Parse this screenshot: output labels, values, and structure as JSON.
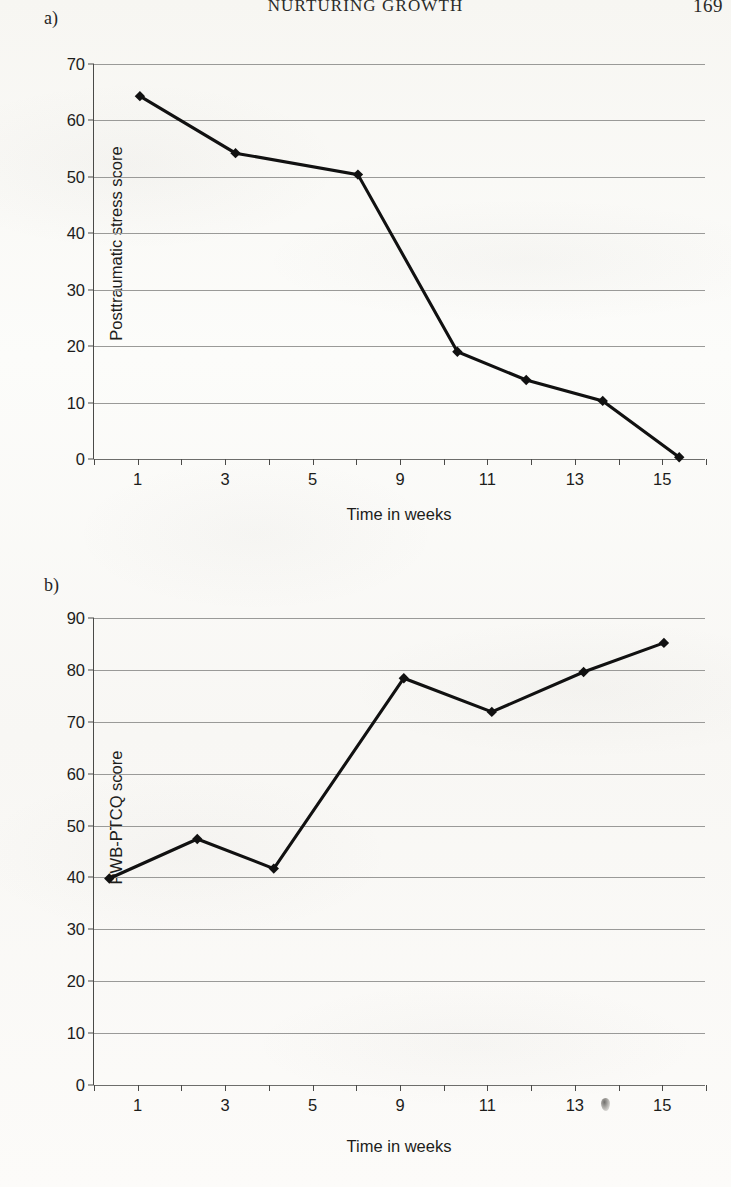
{
  "page": {
    "running_head": "NURTURING GROWTH",
    "folio": "169"
  },
  "panels": {
    "a_label": "a)",
    "b_label": "b)"
  },
  "chart_data": [
    {
      "type": "line",
      "panel": "a)",
      "title": "",
      "xlabel": "Time in weeks",
      "ylabel": "Posttraumatic stress score",
      "xlim": [
        0,
        16
      ],
      "ylim": [
        0,
        70
      ],
      "ytick_labels": [
        "0",
        "10",
        "20",
        "30",
        "40",
        "50",
        "60",
        "70"
      ],
      "yticks": [
        0,
        10,
        20,
        30,
        40,
        50,
        60,
        70
      ],
      "xtick_labels": [
        "1",
        "3",
        "5",
        "9",
        "11",
        "13",
        "15"
      ],
      "xticks": [
        1,
        3,
        5,
        9,
        11,
        13,
        15
      ],
      "grid": true,
      "legend": "none",
      "marker": "filled-diamond",
      "line_color": "#111111",
      "x": [
        1.2,
        3.7,
        6.9,
        9.5,
        11.3,
        13.3,
        15.3
      ],
      "values": [
        64.3,
        54.2,
        50.4,
        19.0,
        14.0,
        10.3,
        0.3
      ]
    },
    {
      "type": "line",
      "panel": "b)",
      "title": "",
      "xlabel": "Time in weeks",
      "ylabel": "PWB-PTCQ score",
      "xlim": [
        0,
        16
      ],
      "ylim": [
        0,
        90
      ],
      "ytick_labels": [
        "0",
        "10",
        "20",
        "30",
        "40",
        "50",
        "60",
        "70",
        "80",
        "90"
      ],
      "yticks": [
        0,
        10,
        20,
        30,
        40,
        50,
        60,
        70,
        80,
        90
      ],
      "xtick_labels": [
        "1",
        "3",
        "5",
        "9",
        "11",
        "13",
        "15"
      ],
      "xticks": [
        1,
        3,
        5,
        9,
        11,
        13,
        15
      ],
      "grid": true,
      "legend": "none",
      "marker": "filled-diamond",
      "line_color": "#111111",
      "x": [
        0.4,
        2.7,
        4.7,
        8.1,
        10.4,
        12.8,
        14.9
      ],
      "values": [
        39.8,
        47.4,
        41.7,
        78.4,
        71.9,
        79.6,
        85.2
      ]
    }
  ]
}
